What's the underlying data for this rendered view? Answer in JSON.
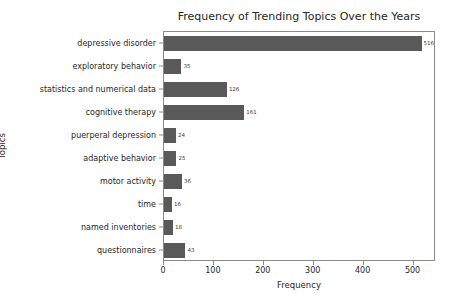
{
  "chart_data": {
    "type": "bar",
    "orientation": "horizontal",
    "title": "Frequency of Trending Topics Over the Years",
    "xlabel": "Frequency",
    "ylabel": "Topics",
    "categories": [
      "depressive disorder",
      "exploratory behavior",
      "statistics and numerical data",
      "cognitive therapy",
      "puerperal depression",
      "adaptive behavior",
      "motor activity",
      "time",
      "named inventories",
      "questionnaires"
    ],
    "values": [
      516,
      35,
      126,
      161,
      24,
      25,
      36,
      16,
      18,
      43
    ],
    "value_labels": [
      "516",
      "35",
      "126",
      "161",
      "24",
      "25",
      "36",
      "16",
      "18",
      "43"
    ],
    "xticks": [
      0,
      100,
      200,
      300,
      400,
      500
    ],
    "xtick_labels": [
      "0",
      "100",
      "200",
      "300",
      "400",
      "500"
    ],
    "xlim": [
      0,
      545
    ],
    "grid": false,
    "legend": false,
    "bar_color": "#595959",
    "axes_color": "#8a8a8a",
    "text_color": "#262626",
    "background": "#ffffff"
  }
}
